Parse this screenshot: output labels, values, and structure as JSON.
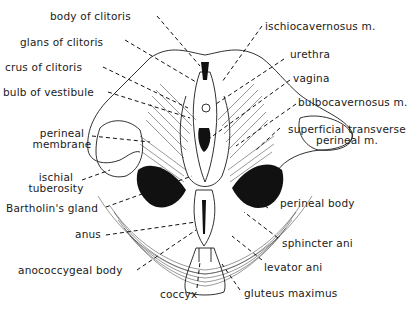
{
  "figure": {
    "labels": {
      "body_of_clitoris": "body of clitoris",
      "glans_of_clitoris": "glans of clitoris",
      "crus_of_clitoris": "crus of clitoris",
      "bulb_of_vestibule": "bulb of vestibule",
      "perineal_membrane": [
        "perineal",
        "membrane"
      ],
      "ischial_tuberosity": [
        "ischial",
        "tuberosity"
      ],
      "bartholins_gland": "Bartholin's gland",
      "anus": "anus",
      "anococcygeal_body": "anococcygeal body",
      "coccyx": "coccyx",
      "ischiocavernosus": "ischiocavernosus m.",
      "urethra": "urethra",
      "vagina": "vagina",
      "bulbocavernosus": "bulbocavernosus m.",
      "superficial_transverse": [
        "superficial transverse",
        "perineal m."
      ],
      "perineal_body": "perineal body",
      "sphincter_ani": "sphincter ani",
      "levator_ani": "levator ani",
      "gluteus_maximus": "gluteus maximus"
    }
  }
}
